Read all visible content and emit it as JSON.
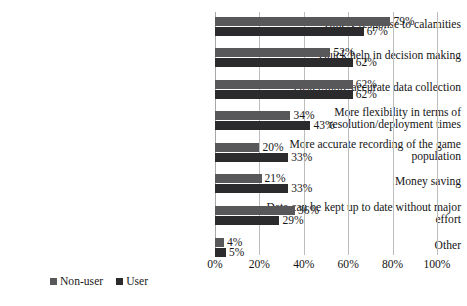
{
  "chart_data": {
    "type": "bar",
    "orientation": "horizontal",
    "title": "",
    "xlabel": "",
    "ylabel": "",
    "xlim": [
      0,
      100
    ],
    "xticks": [
      "0%",
      "20%",
      "40%",
      "60%",
      "80%",
      "100%"
    ],
    "xtick_values": [
      0,
      20,
      40,
      60,
      80,
      100
    ],
    "grid": "vertical",
    "legend_position": "bottom-left",
    "value_suffix": "%",
    "categories": [
      "Timely response to calamities",
      "Quick help in decision making",
      "Faster/more accurate data collection",
      "More flexibility in terms of resolution/deployment times",
      "More accurate recording of the game population",
      "Money saving",
      "Data can be kept up to date without major effort",
      "Other"
    ],
    "category_lines": [
      [
        "Timely response to calamities"
      ],
      [
        "Quick help in decision making"
      ],
      [
        "Faster/more accurate data collection"
      ],
      [
        "More flexibility in terms of",
        "resolution/deployment times"
      ],
      [
        "More accurate recording of the game",
        "population"
      ],
      [
        "Money saving"
      ],
      [
        "Data can be kept up to date without major",
        "effort"
      ],
      [
        "Other"
      ]
    ],
    "series": [
      {
        "name": "Non-user",
        "color": "#58585a",
        "values": [
          79,
          52,
          62,
          34,
          20,
          21,
          36,
          4
        ],
        "labels": [
          "79%",
          "52%",
          "62%",
          "34%",
          "20%",
          "21%",
          "36%",
          "4%"
        ]
      },
      {
        "name": "User",
        "color": "#2b2b2d",
        "values": [
          67,
          62,
          62,
          43,
          33,
          33,
          29,
          5
        ],
        "labels": [
          "67%",
          "62%",
          "62%",
          "43%",
          "33%",
          "33%",
          "29%",
          "5%"
        ]
      }
    ]
  },
  "legend": {
    "items": [
      {
        "label": "Non-user",
        "color": "#58585a"
      },
      {
        "label": "User",
        "color": "#2b2b2d"
      }
    ]
  }
}
